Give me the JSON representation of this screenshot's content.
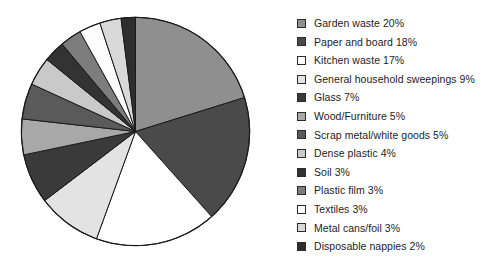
{
  "chart_data": {
    "type": "pie",
    "title": "",
    "subtitle": "",
    "xlabel": "",
    "ylabel": "",
    "grid": false,
    "legend_position": "right",
    "start_angle_deg": 0,
    "direction": "clockwise",
    "units": "percent",
    "categories": [
      "Garden waste",
      "Paper and board",
      "Kitchen waste",
      "General household sweepings",
      "Glass",
      "Wood/Furniture",
      "Scrap metal/white goods",
      "Dense plastic",
      "Soil",
      "Plastic film",
      "Textiles",
      "Metal cans/foil",
      "Disposable nappies"
    ],
    "values": [
      20,
      18,
      17,
      9,
      7,
      5,
      5,
      4,
      3,
      3,
      3,
      3,
      2
    ],
    "value_labels": [
      "20%",
      "18%",
      "17%",
      "9%",
      "7%",
      "5%",
      "5%",
      "4%",
      "3%",
      "3%",
      "3%",
      "3%",
      "2%"
    ],
    "colors": [
      "#8f8f8f",
      "#4a4a4a",
      "#ffffff",
      "#e3e3e3",
      "#3a3a3a",
      "#a8a8a8",
      "#5a5a5a",
      "#c9c9c9",
      "#333333",
      "#7d7d7d",
      "#fdfdfd",
      "#d9d9d9",
      "#2e2e2e"
    ],
    "slice_border_color": "#1a1a1a"
  },
  "legend": {
    "items": [
      {
        "label": "Garden waste  20%",
        "swatch": "#8f8f8f"
      },
      {
        "label": "Paper and board  18%",
        "swatch": "#4a4a4a"
      },
      {
        "label": "Kitchen waste  17%",
        "swatch": "#ffffff"
      },
      {
        "label": "General household sweepings  9%",
        "swatch": "#e3e3e3"
      },
      {
        "label": "Glass  7%",
        "swatch": "#3a3a3a"
      },
      {
        "label": "Wood/Furniture  5%",
        "swatch": "#a8a8a8"
      },
      {
        "label": "Scrap metal/white goods  5%",
        "swatch": "#5a5a5a"
      },
      {
        "label": "Dense plastic  4%",
        "swatch": "#c9c9c9"
      },
      {
        "label": "Soil  3%",
        "swatch": "#333333"
      },
      {
        "label": "Plastic film  3%",
        "swatch": "#7d7d7d"
      },
      {
        "label": "Textiles  3%",
        "swatch": "#fdfdfd"
      },
      {
        "label": "Metal cans/foil  3%",
        "swatch": "#d9d9d9"
      },
      {
        "label": "Disposable nappies  2%",
        "swatch": "#2e2e2e"
      }
    ]
  }
}
